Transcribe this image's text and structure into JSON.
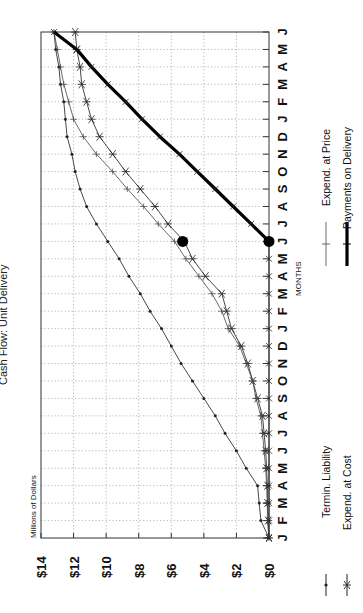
{
  "title": "Cash Flow: Unit Delivery",
  "ylabel": "Millions of Dollars",
  "xlabel": "MONTHS",
  "chart_data": {
    "type": "line",
    "title": "Cash Flow: Unit Delivery",
    "xlabel": "MONTHS",
    "ylabel": "Millions of Dollars",
    "orientation": "rotated 90° counter-clockwise (dollar axis runs horizontally, months run vertically)",
    "ylim": [
      0,
      14
    ],
    "yticks": [
      "$0",
      "$2",
      "$4",
      "$6",
      "$8",
      "$10",
      "$12",
      "$14"
    ],
    "grid": true,
    "legend_position": "bottom (rotated)",
    "categories": [
      "J",
      "F",
      "M",
      "A",
      "M",
      "J",
      "J",
      "A",
      "S",
      "O",
      "N",
      "D",
      "J",
      "F",
      "M",
      "A",
      "M",
      "J",
      "J",
      "A",
      "S",
      "O",
      "N",
      "D",
      "J",
      "F",
      "M",
      "A",
      "M",
      "J"
    ],
    "series": [
      {
        "name": "Termin. Liability",
        "marker": "small dot",
        "values": [
          0.0,
          0.5,
          0.6,
          0.7,
          1.4,
          2.0,
          2.7,
          3.3,
          4.0,
          4.7,
          5.4,
          6.0,
          6.6,
          7.3,
          7.9,
          8.6,
          9.2,
          9.9,
          10.6,
          11.2,
          11.6,
          11.9,
          12.1,
          12.4,
          12.5,
          12.6,
          12.8,
          12.9,
          13.1,
          13.2
        ]
      },
      {
        "name": "Expend. at Cost",
        "marker": "asterisk",
        "values": [
          0.0,
          0.05,
          0.1,
          0.1,
          0.15,
          0.2,
          0.3,
          0.4,
          0.7,
          1.0,
          1.3,
          1.7,
          2.3,
          2.6,
          2.9,
          3.9,
          4.7,
          5.2,
          6.2,
          7.0,
          7.9,
          8.8,
          9.6,
          10.4,
          10.9,
          11.2,
          11.5,
          11.6,
          11.8,
          11.9
        ]
      },
      {
        "name": "Expend. at Price",
        "marker": "plus",
        "values": [
          0.0,
          0.1,
          0.1,
          0.15,
          0.2,
          0.3,
          0.4,
          0.5,
          0.8,
          1.0,
          1.4,
          1.8,
          2.5,
          2.9,
          3.5,
          4.3,
          5.1,
          5.8,
          6.8,
          7.7,
          8.7,
          9.6,
          10.6,
          11.4,
          12.0,
          12.3,
          12.6,
          12.8,
          13.0,
          13.2
        ]
      },
      {
        "name": "Payments on Delivery",
        "marker": "x, thick line",
        "values": [
          0.0,
          0.0,
          0.0,
          0.0,
          0.0,
          0.0,
          0.0,
          0.0,
          0.0,
          0.0,
          0.0,
          0.0,
          0.0,
          0.0,
          0.0,
          0.0,
          0.0,
          0.0,
          1.1,
          2.2,
          3.3,
          4.4,
          5.5,
          6.7,
          7.8,
          8.8,
          9.9,
          10.9,
          11.8,
          13.2
        ]
      }
    ],
    "annotations": [
      {
        "type": "large dot",
        "month_index": 17,
        "value": 5.3
      },
      {
        "type": "large dot",
        "month_index": 17,
        "value": 0.0
      }
    ]
  },
  "legend": [
    {
      "label": "Termin. Liability",
      "symbol": "dot"
    },
    {
      "label": "Expend. at Cost",
      "symbol": "asterisk"
    },
    {
      "label": "Expend. at Price",
      "symbol": "plus"
    },
    {
      "label": "Payments on Delivery",
      "symbol": "thick"
    }
  ]
}
